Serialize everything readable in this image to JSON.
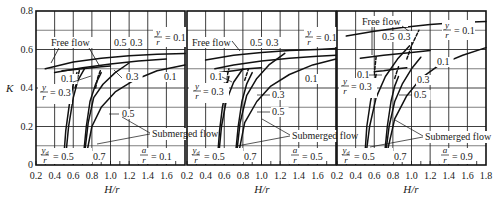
{
  "chart_data": [
    {
      "type": "line",
      "panel": "a/r = 0.1",
      "xlabel": "H/r",
      "ylabel": "K",
      "xlim": [
        0.2,
        1.8
      ],
      "ylim": [
        0,
        0.8
      ],
      "xticks": [
        "0.2",
        "0.4",
        "0.6",
        "0.8",
        "1.0",
        "1.2",
        "1.4",
        "1.6"
      ],
      "yticks": [
        "0",
        "0.2",
        "0.4",
        "0.6",
        "0.8"
      ],
      "grid": true,
      "annotation": {
        "num": "a",
        "den": "r",
        "value": "0.1"
      },
      "series": [
        {
          "name": "Free flow y/r=0.1",
          "style": "solid",
          "x": [
            0.3,
            0.6,
            0.9,
            1.2,
            1.5,
            1.8
          ],
          "y": [
            0.5,
            0.535,
            0.555,
            0.568,
            0.575,
            0.58
          ]
        },
        {
          "name": "Free flow y/r=0.3",
          "style": "solid",
          "x": [
            0.4,
            0.7,
            1.0,
            1.3,
            1.6
          ],
          "y": [
            0.48,
            0.505,
            0.525,
            0.54,
            0.55
          ]
        },
        {
          "name": "Free flow y/r=0.5",
          "style": "solid",
          "x": [
            0.48,
            0.7,
            0.9,
            1.0
          ],
          "y": [
            0.49,
            0.5,
            0.51,
            0.515
          ]
        },
        {
          "name": "Submerged yd/r=0.5, y/r=0.1",
          "style": "solid",
          "x": [
            0.52,
            0.55,
            0.6,
            0.65,
            0.72
          ],
          "y": [
            0.05,
            0.2,
            0.35,
            0.44,
            0.5
          ]
        },
        {
          "name": "Submerged yd/r=0.5, y/r=0.3",
          "style": "solid",
          "x": [
            0.5,
            0.52,
            0.56,
            0.6,
            0.64
          ],
          "y": [
            0.05,
            0.18,
            0.32,
            0.42,
            0.48
          ]
        },
        {
          "name": "Submerged yd/r=0.5 dashed",
          "style": "dashed",
          "x": [
            0.62,
            0.65,
            0.67
          ],
          "y": [
            0.4,
            0.46,
            0.5
          ]
        },
        {
          "name": "Submerged yd/r=0.7, y/r=0.1",
          "style": "solid",
          "x": [
            0.74,
            0.8,
            0.9,
            1.05,
            1.25,
            1.5,
            1.8
          ],
          "y": [
            0.05,
            0.2,
            0.3,
            0.38,
            0.44,
            0.49,
            0.52
          ]
        },
        {
          "name": "Submerged yd/r=0.7, y/r=0.3",
          "style": "solid",
          "x": [
            0.72,
            0.76,
            0.82,
            0.92,
            1.05,
            1.2
          ],
          "y": [
            0.05,
            0.22,
            0.35,
            0.42,
            0.48,
            0.53
          ]
        },
        {
          "name": "Submerged yd/r=0.7, y/r=0.5",
          "style": "solid",
          "x": [
            0.71,
            0.74,
            0.78,
            0.84,
            0.9
          ],
          "y": [
            0.05,
            0.2,
            0.33,
            0.42,
            0.48
          ]
        },
        {
          "name": "Submerged yd/r=0.7 dashed",
          "style": "dashed",
          "x": [
            0.84,
            0.86,
            0.89
          ],
          "y": [
            0.4,
            0.45,
            0.49
          ]
        }
      ],
      "labels": {
        "free_flow": "Free flow",
        "submerged_flow": "Submerged flow",
        "y_over_r_top": [
          "0.5",
          "0.3",
          "y/r = 0.1"
        ],
        "curve_labels": [
          "0.1",
          "y/r = 0.3",
          "0.3",
          "0.1",
          "0.5"
        ],
        "yd_over_r": [
          "yd/r = 0.5",
          "0.7"
        ]
      }
    },
    {
      "type": "line",
      "panel": "a/r = 0.5",
      "xlabel": "H/r",
      "ylabel": "K",
      "xlim": [
        0.2,
        1.8
      ],
      "ylim": [
        0,
        0.8
      ],
      "xticks": [
        "0.2",
        "0.4",
        "0.6",
        "0.8",
        "1.0",
        "1.2",
        "1.4",
        "1.6"
      ],
      "grid": true,
      "annotation": {
        "num": "a",
        "den": "r",
        "value": "0.5"
      },
      "series": [
        {
          "name": "Free flow y/r=0.1",
          "style": "solid",
          "x": [
            0.4,
            0.7,
            1.0,
            1.3,
            1.6,
            1.8
          ],
          "y": [
            0.545,
            0.57,
            0.585,
            0.595,
            0.6,
            0.605
          ]
        },
        {
          "name": "Free flow y/r=0.3",
          "style": "solid",
          "x": [
            0.5,
            0.7,
            1.0,
            1.3,
            1.6,
            1.8
          ],
          "y": [
            0.5,
            0.52,
            0.54,
            0.555,
            0.565,
            0.57
          ]
        },
        {
          "name": "Free flow y/r=0.5",
          "style": "solid",
          "x": [
            0.55,
            0.7,
            0.85,
            1.0
          ],
          "y": [
            0.48,
            0.49,
            0.5,
            0.505
          ]
        },
        {
          "name": "Submerged yd/r=0.5, y/r=0.1",
          "style": "solid",
          "x": [
            0.54,
            0.57,
            0.62,
            0.7,
            0.8
          ],
          "y": [
            0.05,
            0.2,
            0.33,
            0.43,
            0.5
          ]
        },
        {
          "name": "Submerged yd/r=0.5, y/r=0.3",
          "style": "solid",
          "x": [
            0.53,
            0.55,
            0.58,
            0.62,
            0.65
          ],
          "y": [
            0.05,
            0.18,
            0.3,
            0.4,
            0.46
          ]
        },
        {
          "name": "Submerged yd/r=0.5 dashed",
          "style": "dashed",
          "x": [
            0.62,
            0.63,
            0.65
          ],
          "y": [
            0.42,
            0.46,
            0.5
          ]
        },
        {
          "name": "Submerged yd/r=0.7, y/r=0.1",
          "style": "solid",
          "x": [
            0.75,
            0.82,
            0.95,
            1.1,
            1.3,
            1.55,
            1.8
          ],
          "y": [
            0.05,
            0.22,
            0.33,
            0.41,
            0.47,
            0.52,
            0.55
          ]
        },
        {
          "name": "Submerged yd/r=0.7, y/r=0.3",
          "style": "solid",
          "x": [
            0.73,
            0.77,
            0.84,
            0.95,
            1.08,
            1.25
          ],
          "y": [
            0.05,
            0.22,
            0.36,
            0.45,
            0.52,
            0.58
          ]
        },
        {
          "name": "Submerged yd/r=0.7, y/r=0.5",
          "style": "solid",
          "x": [
            0.72,
            0.75,
            0.79,
            0.84,
            0.9
          ],
          "y": [
            0.05,
            0.2,
            0.33,
            0.42,
            0.48
          ]
        },
        {
          "name": "Submerged yd/r=0.7 dashed",
          "style": "dashed",
          "x": [
            0.82,
            0.84,
            0.86
          ],
          "y": [
            0.44,
            0.47,
            0.5
          ]
        }
      ],
      "labels": {
        "free_flow": "Free flow",
        "submerged_flow": "Submerged flow",
        "y_over_r_top": [
          "0.5",
          "0.3",
          "y/r = 0.1"
        ],
        "curve_labels": [
          "0.1",
          "y/r = 0.3",
          "0.3",
          "0.5",
          "0.1"
        ],
        "yd_over_r": [
          "yd/r = 0.5",
          "0.7"
        ]
      }
    },
    {
      "type": "line",
      "panel": "a/r = 0.9",
      "xlabel": "H/r",
      "ylabel": "K",
      "xlim": [
        0.2,
        1.8
      ],
      "ylim": [
        0,
        0.8
      ],
      "xticks": [
        "0.2",
        "0.4",
        "0.6",
        "0.8",
        "1.0",
        "1.2",
        "1.4",
        "1.6",
        "1.8"
      ],
      "grid": true,
      "annotation": {
        "num": "a",
        "den": "r",
        "value": "0.9"
      },
      "series": [
        {
          "name": "Free flow y/r=0.1",
          "style": "solid",
          "x": [
            0.3,
            0.6,
            0.9,
            1.2,
            1.5,
            1.8
          ],
          "y": [
            0.67,
            0.695,
            0.715,
            0.73,
            0.74,
            0.745
          ]
        },
        {
          "name": "Free flow y/r=0.3",
          "style": "solid",
          "x": [
            0.45,
            0.7,
            1.0,
            1.2
          ],
          "y": [
            0.555,
            0.57,
            0.585,
            0.595
          ]
        },
        {
          "name": "Free flow y/r=0.5",
          "style": "solid",
          "x": [
            0.5,
            0.7,
            0.85,
            0.95
          ],
          "y": [
            0.48,
            0.49,
            0.5,
            0.505
          ]
        },
        {
          "name": "Submerged yd/r=0.5, y/r=0.1",
          "style": "solid",
          "x": [
            0.51,
            0.55,
            0.62,
            0.72,
            0.85,
            0.98
          ],
          "y": [
            0.05,
            0.2,
            0.35,
            0.46,
            0.55,
            0.62
          ]
        },
        {
          "name": "Submerged yd/r=0.5, y/r=0.3",
          "style": "solid",
          "x": [
            0.5,
            0.52,
            0.56,
            0.6,
            0.62
          ],
          "y": [
            0.05,
            0.2,
            0.33,
            0.42,
            0.47
          ]
        },
        {
          "name": "Submerged yd/r=0.5 dashed",
          "style": "dashed",
          "x": [
            0.6,
            0.61,
            0.62
          ],
          "y": [
            0.47,
            0.52,
            0.56
          ]
        },
        {
          "name": "Submerged yd/r=0.7 dashed top",
          "style": "dashed",
          "x": [
            0.95,
            1.0,
            1.08
          ],
          "y": [
            0.55,
            0.62,
            0.7
          ]
        },
        {
          "name": "Submerged yd/r=0.7, y/r=0.1",
          "style": "solid",
          "x": [
            0.73,
            0.82,
            0.95,
            1.1,
            1.3,
            1.55,
            1.8
          ],
          "y": [
            0.05,
            0.24,
            0.36,
            0.45,
            0.52,
            0.57,
            0.61
          ]
        },
        {
          "name": "Submerged yd/r=0.7, y/r=0.3",
          "style": "solid",
          "x": [
            0.72,
            0.76,
            0.82,
            0.9,
            1.0,
            1.1
          ],
          "y": [
            0.05,
            0.2,
            0.33,
            0.42,
            0.5,
            0.56
          ]
        },
        {
          "name": "Submerged yd/r=0.7, y/r=0.5",
          "style": "solid",
          "x": [
            0.71,
            0.74,
            0.78,
            0.82,
            0.86
          ],
          "y": [
            0.05,
            0.2,
            0.33,
            0.41,
            0.46
          ]
        },
        {
          "name": "Submerged yd/r=0.7 dashed",
          "style": "dashed",
          "x": [
            0.82,
            0.84,
            0.86
          ],
          "y": [
            0.45,
            0.48,
            0.51
          ]
        }
      ],
      "labels": {
        "free_flow": "Free flow",
        "submerged_flow": "Submerged flow",
        "y_over_r_top": [
          "0.5",
          "0.3",
          "y/r = 0.1"
        ],
        "curve_labels": [
          "0.1",
          "y/r = 0.3",
          "0.1",
          "0.3",
          "0.5"
        ],
        "yd_over_r": [
          "yd/r = 0.5",
          "0.7"
        ]
      }
    }
  ],
  "axis": {
    "ylabel": "K",
    "xlabel": "H/r",
    "yticks": [
      "0",
      "0.2",
      "0.4",
      "0.6",
      "0.8"
    ]
  },
  "text": {
    "free_flow": "Free flow",
    "submerged_flow": "Submerged flow",
    "y": "y",
    "r": "r",
    "yd": "y",
    "d": "d",
    "a": "a",
    "eq": "=",
    "v01": "0.1",
    "v03": "0.3",
    "v05": "0.5",
    "v07": "0.7",
    "v09": "0.9"
  }
}
